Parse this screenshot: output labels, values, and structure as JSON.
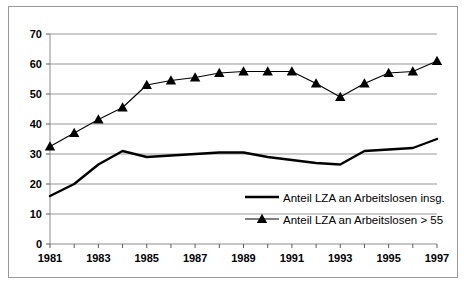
{
  "chart_data": {
    "type": "line",
    "title": "",
    "subtitle": "",
    "xlabel": "",
    "ylabel": "",
    "xlim": [
      1981,
      1997
    ],
    "ylim": [
      0,
      70
    ],
    "ytick_step": 10,
    "yticks": [
      0,
      10,
      20,
      30,
      40,
      50,
      60,
      70
    ],
    "ytick_labels": [
      "0",
      "10",
      "20",
      "30",
      "40",
      "50",
      "60",
      "70"
    ],
    "x": [
      1981,
      1982,
      1983,
      1984,
      1985,
      1986,
      1987,
      1988,
      1989,
      1990,
      1991,
      1992,
      1993,
      1994,
      1995,
      1996,
      1997
    ],
    "xtick_labels": [
      "1981",
      "",
      "1983",
      "",
      "1985",
      "",
      "1987",
      "",
      "1989",
      "",
      "1991",
      "",
      "1993",
      "",
      "1995",
      "",
      "1997"
    ],
    "xticks_labeled": [
      1981,
      1983,
      1985,
      1987,
      1989,
      1991,
      1993,
      1995,
      1997
    ],
    "grid": "horizontal",
    "legend_position": "inside-lower-right",
    "series": [
      {
        "name": "Anteil LZA an Arbeitslosen insg.",
        "marker": "none",
        "line_width": 2.4,
        "color": "#000000",
        "values": [
          16.0,
          20.0,
          26.5,
          31.0,
          29.0,
          29.5,
          30.0,
          30.5,
          30.5,
          29.0,
          28.0,
          27.0,
          26.5,
          31.0,
          31.5,
          32.0,
          35.0
        ]
      },
      {
        "name": "Anteil LZA an Arbeitslosen > 55",
        "marker": "triangle",
        "line_width": 1.1,
        "color": "#000000",
        "values": [
          32.5,
          37.0,
          41.5,
          45.5,
          53.0,
          54.5,
          55.5,
          57.0,
          57.5,
          57.5,
          57.5,
          53.5,
          49.0,
          53.5,
          57.0,
          57.5,
          61.0
        ]
      }
    ]
  },
  "legend": {
    "items": [
      {
        "label": "Anteil LZA an Arbeitslosen insg.",
        "marker": "line"
      },
      {
        "label": "Anteil LZA an Arbeitslosen > 55",
        "marker": "line-triangle"
      }
    ]
  }
}
